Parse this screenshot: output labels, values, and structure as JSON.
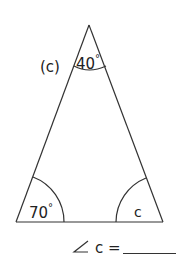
{
  "problem": {
    "label": "(c)"
  },
  "triangle": {
    "apex_angle": {
      "value": "40",
      "unit": "°"
    },
    "bottom_left_angle": {
      "value": "70",
      "unit": "°"
    },
    "bottom_right_angle": {
      "value": "c"
    }
  },
  "answer": {
    "angle_symbol": "∠",
    "variable": "c",
    "equals": "="
  }
}
